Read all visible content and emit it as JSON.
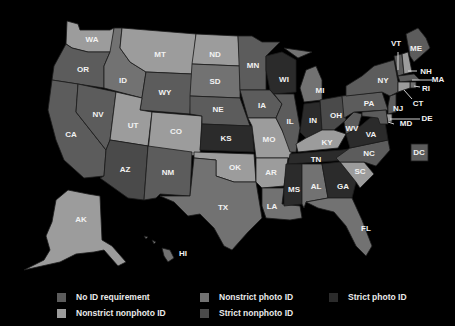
{
  "map": {
    "categories": {
      "none": {
        "label": "No ID requirement",
        "color": "#5c5c5c"
      },
      "nsnp": {
        "label": "Nonstrict nonphoto ID",
        "color": "#9c9c9c"
      },
      "nsp": {
        "label": "Nonstrict photo ID",
        "color": "#727272"
      },
      "snp": {
        "label": "Strict nonphoto ID",
        "color": "#4a4a4a"
      },
      "sp": {
        "label": "Strict photo ID",
        "color": "#2b2b2b"
      }
    },
    "states": {
      "WA": "nsnp",
      "OR": "none",
      "CA": "none",
      "NV": "none",
      "ID": "nsp",
      "MT": "nsnp",
      "WY": "none",
      "UT": "nsnp",
      "CO": "nsnp",
      "AZ": "snp",
      "NM": "none",
      "ND": "nsnp",
      "SD": "nsp",
      "NE": "none",
      "KS": "sp",
      "OK": "nsnp",
      "TX": "nsp",
      "MN": "none",
      "IA": "none",
      "MO": "nsnp",
      "AR": "nsnp",
      "LA": "nsp",
      "WI": "sp",
      "IL": "none",
      "MI": "nsp",
      "IN": "sp",
      "OH": "snp",
      "KY": "nsnp",
      "TN": "sp",
      "MS": "sp",
      "AL": "nsp",
      "GA": "sp",
      "FL": "nsp",
      "SC": "nsnp",
      "NC": "none",
      "VA": "sp",
      "WV": "none",
      "PA": "none",
      "NY": "none",
      "VT": "none",
      "NH": "nsnp",
      "ME": "none",
      "MA": "none",
      "RI": "nsp",
      "CT": "nsnp",
      "NJ": "none",
      "DE": "nsnp",
      "MD": "none",
      "DC": "none",
      "AK": "nsnp",
      "HI": "nsp"
    },
    "labels": {
      "WA": "WA",
      "OR": "OR",
      "CA": "CA",
      "NV": "NV",
      "ID": "ID",
      "MT": "MT",
      "WY": "WY",
      "UT": "UT",
      "CO": "CO",
      "AZ": "AZ",
      "NM": "NM",
      "ND": "ND",
      "SD": "SD",
      "NE": "NE",
      "KS": "KS",
      "OK": "OK",
      "TX": "TX",
      "MN": "MN",
      "IA": "IA",
      "MO": "MO",
      "AR": "AR",
      "LA": "LA",
      "WI": "WI",
      "IL": "IL",
      "MI": "MI",
      "IN": "IN",
      "OH": "OH",
      "KY": "KY",
      "TN": "TN",
      "MS": "MS",
      "AL": "AL",
      "GA": "GA",
      "FL": "FL",
      "SC": "SC",
      "NC": "NC",
      "VA": "VA",
      "WV": "WV",
      "PA": "PA",
      "NY": "NY",
      "VT": "VT",
      "NH": "NH",
      "ME": "ME",
      "MA": "MA",
      "RI": "RI",
      "CT": "CT",
      "NJ": "NJ",
      "DE": "DE",
      "MD": "MD",
      "DC": "DC",
      "AK": "AK",
      "HI": "HI"
    }
  },
  "legend": {
    "items": [
      {
        "label": "No ID requirement",
        "color": "#5c5c5c"
      },
      {
        "label": "Nonstrict photo ID",
        "color": "#727272"
      },
      {
        "label": "Strict photo ID",
        "color": "#2b2b2b"
      },
      {
        "label": "Nonstrict nonphoto ID",
        "color": "#9c9c9c"
      },
      {
        "label": "Strict nonphoto ID",
        "color": "#4a4a4a"
      }
    ]
  }
}
